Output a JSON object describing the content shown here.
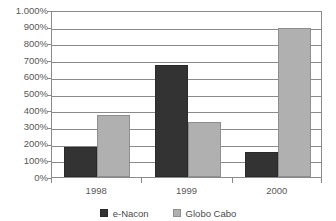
{
  "chart_data": {
    "type": "bar",
    "title": "",
    "subtitle": "",
    "xlabel": "",
    "ylabel": "",
    "categories": [
      "1998",
      "1999",
      "2000"
    ],
    "series": [
      {
        "name": "e-Nacon",
        "color": "#333333",
        "values": [
          180,
          670,
          150
        ]
      },
      {
        "name": "Globo Cabo",
        "color": "#b0b0b0",
        "values": [
          370,
          330,
          895
        ]
      }
    ],
    "ylim": [
      0,
      1000
    ],
    "y_tick_step": 100,
    "y_tick_labels": [
      "0%",
      "100%",
      "200%",
      "300%",
      "400%",
      "500%",
      "600%",
      "700%",
      "800%",
      "900%",
      "1.000%"
    ],
    "y_tick_values": [
      0,
      100,
      200,
      300,
      400,
      500,
      600,
      700,
      800,
      900,
      1000
    ],
    "grid": true,
    "grid_axis": "y",
    "legend": true,
    "legend_position": "bottom",
    "value_suffix": "%",
    "background_color": "#ffffff",
    "axis_color": "#8a8a8a",
    "text_color": "#585858"
  }
}
